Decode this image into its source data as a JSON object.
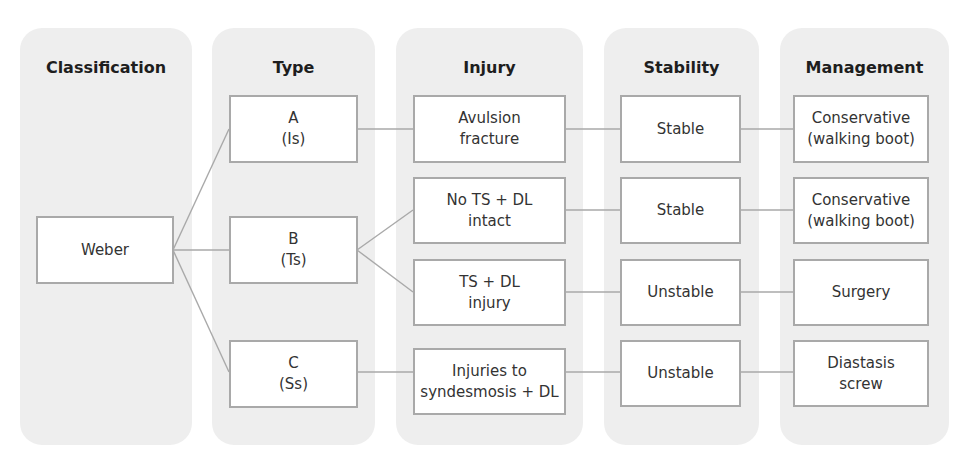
{
  "columns": [
    {
      "title": "Classification"
    },
    {
      "title": "Type"
    },
    {
      "title": "Injury"
    },
    {
      "title": "Stability"
    },
    {
      "title": "Management"
    }
  ],
  "classification": {
    "label": "Weber"
  },
  "types": [
    {
      "label": "A\n(Is)"
    },
    {
      "label": "B\n(Ts)"
    },
    {
      "label": "C\n(Ss)"
    }
  ],
  "injuries": [
    {
      "label": "Avulsion\nfracture"
    },
    {
      "label": "No TS + DL\nintact"
    },
    {
      "label": "TS + DL\ninjury"
    },
    {
      "label": "Injuries to\nsyndesmosis + DL"
    }
  ],
  "stability": [
    {
      "label": "Stable"
    },
    {
      "label": "Stable"
    },
    {
      "label": "Unstable"
    },
    {
      "label": "Unstable"
    }
  ],
  "management": [
    {
      "label": "Conservative\n(walking boot)"
    },
    {
      "label": "Conservative\n(walking boot)"
    },
    {
      "label": "Surgery"
    },
    {
      "label": "Diastasis\nscrew"
    }
  ]
}
